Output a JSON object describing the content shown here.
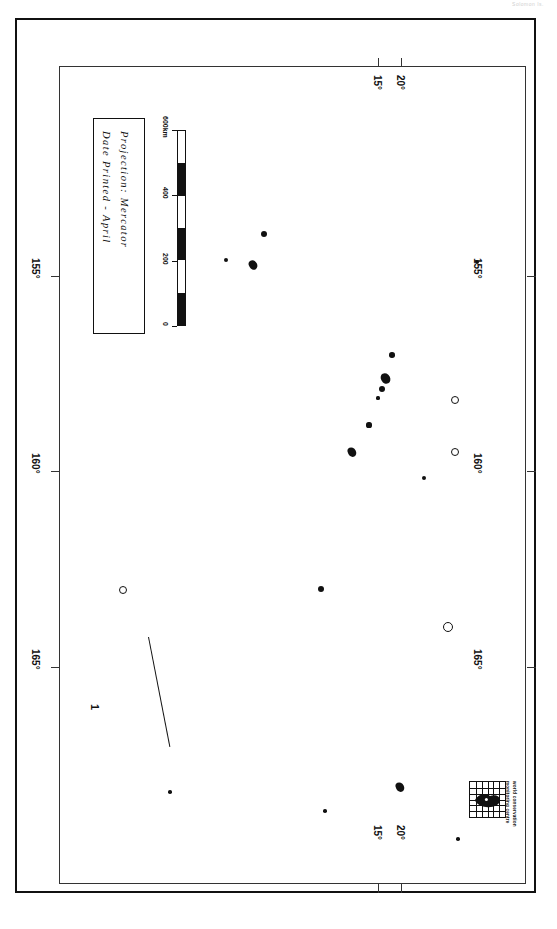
{
  "document": {
    "kind": "printed-map-sheet",
    "orientation": "rotated-90",
    "header_faint_text": "Solomon Is."
  },
  "title_box": {
    "line1": "Projection: Mercator",
    "line2": "Date Printed - April"
  },
  "scale_bar": {
    "unit_label": "600km",
    "labels": [
      "0",
      "200",
      "400",
      "600km"
    ],
    "values": [
      0,
      200,
      400,
      600
    ]
  },
  "axes": {
    "longitude": {
      "label_suffix": "°",
      "ticks": [
        "155°",
        "160°",
        "165°"
      ],
      "values": [
        155,
        160,
        165
      ]
    },
    "latitude": {
      "label_suffix": "°",
      "ticks": [
        "15°",
        "20°"
      ],
      "values": [
        15,
        20
      ]
    }
  },
  "annotations": {
    "callout_1": "1"
  },
  "logo": {
    "line1": "world conservation",
    "line2": "monitoring centre"
  },
  "colors": {
    "ink": "#111111",
    "frame": "#333333",
    "paper": "#ffffff",
    "faint": "#cfcfcf"
  },
  "chart_data": {
    "type": "scatter",
    "title": "Projection: Mercator",
    "xlabel": "Latitude (°S)",
    "ylabel": "Longitude (°E)",
    "xlim": [
      12.0,
      22.5
    ],
    "ylim": [
      152.5,
      167.5
    ],
    "grid": false,
    "legend": "none",
    "note": "Rotated map sheet: screen-x increases with latitude south, screen-y increases as longitude decreases.",
    "markers": [
      {
        "px": 104,
        "py": 568,
        "r": 3.0,
        "shape": "ring",
        "name": "island-1"
      },
      {
        "px": 208,
        "py": 239,
        "r": 2.4,
        "shape": "dot",
        "name": "island-2"
      },
      {
        "px": 235,
        "py": 243,
        "r": 4.0,
        "shape": "blob",
        "name": "island-3"
      },
      {
        "px": 246,
        "py": 213,
        "r": 3.0,
        "shape": "dot",
        "name": "island-4"
      },
      {
        "px": 303,
        "py": 568,
        "r": 3.0,
        "shape": "dot",
        "name": "island-5"
      },
      {
        "px": 334,
        "py": 430,
        "r": 4.2,
        "shape": "blob",
        "name": "island-6"
      },
      {
        "px": 351,
        "py": 404,
        "r": 2.6,
        "shape": "dot",
        "name": "island-7"
      },
      {
        "px": 360,
        "py": 377,
        "r": 1.6,
        "shape": "dot",
        "name": "island-8"
      },
      {
        "px": 364,
        "py": 368,
        "r": 3.0,
        "shape": "dot",
        "name": "island-9"
      },
      {
        "px": 367,
        "py": 356,
        "r": 4.4,
        "shape": "blob",
        "name": "island-10"
      },
      {
        "px": 374,
        "py": 334,
        "r": 2.8,
        "shape": "dot",
        "name": "island-11"
      },
      {
        "px": 406,
        "py": 457,
        "r": 2.2,
        "shape": "dot",
        "name": "island-12"
      },
      {
        "px": 429,
        "py": 605,
        "r": 4.2,
        "shape": "ring",
        "name": "island-13"
      },
      {
        "px": 436,
        "py": 430,
        "r": 3.4,
        "shape": "ring",
        "name": "island-14"
      },
      {
        "px": 436,
        "py": 378,
        "r": 3.2,
        "shape": "ring",
        "name": "island-15"
      },
      {
        "px": 459,
        "py": 241,
        "r": 2.2,
        "shape": "dot",
        "name": "island-16"
      },
      {
        "px": 152,
        "py": 771,
        "r": 1.8,
        "shape": "dot",
        "name": "island-17"
      },
      {
        "px": 307,
        "py": 790,
        "r": 1.8,
        "shape": "dot",
        "name": "island-18"
      },
      {
        "px": 382,
        "py": 765,
        "r": 4.2,
        "shape": "blob",
        "name": "island-19"
      },
      {
        "px": 440,
        "py": 818,
        "r": 1.8,
        "shape": "dot",
        "name": "island-20"
      }
    ]
  }
}
